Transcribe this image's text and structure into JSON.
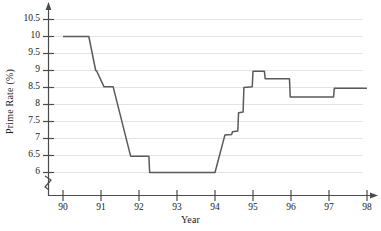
{
  "chart_data": {
    "type": "line",
    "title": "",
    "xlabel": "Year",
    "ylabel": "Prime Rate (%)",
    "xlim": [
      89.6,
      98.4
    ],
    "ylim": [
      5.75,
      10.75
    ],
    "grid": true,
    "legend": null,
    "axis_break_y": true,
    "y_ticks": [
      6,
      6.5,
      7,
      7.5,
      8,
      8.5,
      9,
      9.5,
      10,
      10.5
    ],
    "y_tick_labels": [
      "6",
      "6.5",
      "7",
      "7.5",
      "8",
      "8.5",
      "9",
      "9.5",
      "10",
      "10.5"
    ],
    "x_ticks": [
      90,
      91,
      92,
      93,
      94,
      95,
      96,
      97,
      98
    ],
    "x_tick_labels": [
      "90",
      "91",
      "92",
      "93",
      "94",
      "95",
      "96",
      "97",
      "98"
    ],
    "series": [
      {
        "name": "Prime Rate",
        "color": "#5a5a5a",
        "x": [
          90.0,
          90.66,
          90.68,
          90.86,
          90.88,
          91.08,
          91.1,
          91.32,
          91.78,
          91.8,
          92.26,
          92.28,
          94.0,
          94.26,
          94.44,
          94.46,
          94.6,
          94.62,
          94.74,
          94.76,
          94.98,
          95.0,
          95.3,
          95.32,
          95.72,
          95.74,
          95.96,
          95.98,
          97.12,
          97.14,
          98.0
        ],
        "y": [
          10.0,
          10.0,
          10.0,
          9.0,
          9.0,
          8.52,
          8.52,
          8.52,
          6.48,
          6.48,
          6.48,
          6.0,
          6.0,
          7.1,
          7.12,
          7.2,
          7.22,
          7.76,
          7.78,
          8.5,
          8.52,
          8.98,
          8.98,
          8.76,
          8.76,
          8.76,
          8.76,
          8.22,
          8.22,
          8.48,
          8.48
        ]
      }
    ],
    "annotations": []
  },
  "axes": {
    "y_title": "Prime Rate (%)",
    "x_title": "Year",
    "y_tick_labels": [
      "10.5",
      "10",
      "9.5",
      "9",
      "8.5",
      "8",
      "7.5",
      "7",
      "6.5",
      "6"
    ],
    "x_tick_labels": [
      "90",
      "91",
      "92",
      "93",
      "94",
      "95",
      "96",
      "97",
      "98"
    ]
  },
  "style": {
    "line_color": "#5a5a5a",
    "grid_color": "#e2e2e2",
    "axis_color": "#4a4a4a",
    "background": "#ffffff",
    "text_color": "#1a1a1a"
  }
}
